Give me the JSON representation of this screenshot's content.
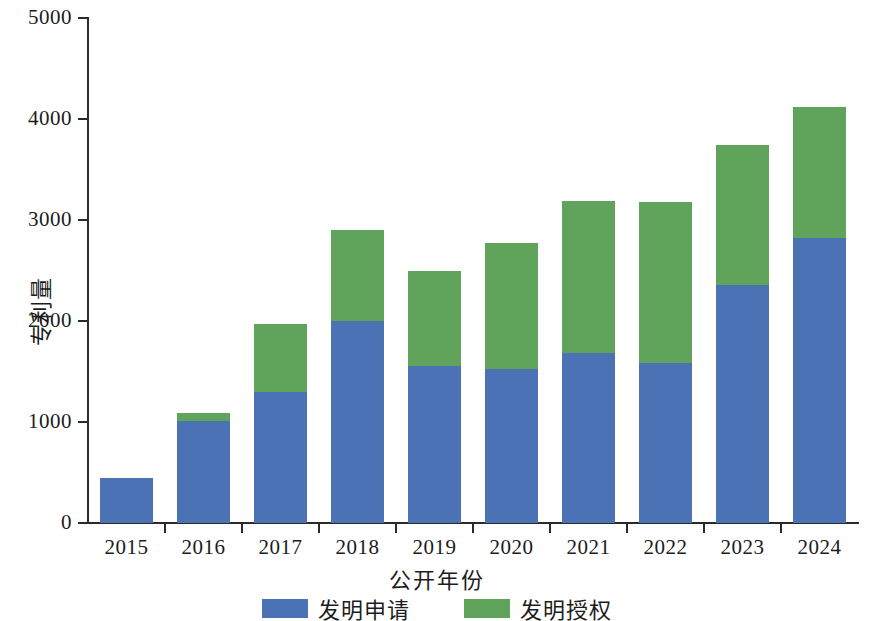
{
  "chart_data": {
    "type": "bar",
    "stacked": true,
    "title": "",
    "xlabel": "公开年份",
    "ylabel": "专利量",
    "categories": [
      "2015",
      "2016",
      "2017",
      "2018",
      "2019",
      "2020",
      "2021",
      "2022",
      "2023",
      "2024"
    ],
    "series": [
      {
        "name": "发明申请",
        "color": "#4a72b5",
        "values": [
          450,
          1010,
          1300,
          2000,
          1555,
          1520,
          1680,
          1580,
          2355,
          2820
        ]
      },
      {
        "name": "发明授权",
        "color": "#5fa45a",
        "values": [
          0,
          80,
          670,
          900,
          945,
          1250,
          1510,
          1600,
          1385,
          1300
        ]
      }
    ],
    "totals": [
      450,
      1090,
      1970,
      2900,
      2500,
      2770,
      3190,
      3180,
      3740,
      4120
    ],
    "ylim": [
      0,
      5000
    ],
    "yticks": [
      0,
      1000,
      2000,
      3000,
      4000,
      5000
    ],
    "ytick_labels": [
      "0",
      "1000",
      "2000",
      "3000",
      "4000",
      "5000"
    ],
    "grid": false,
    "legend_position": "bottom"
  },
  "legend": {
    "items": [
      {
        "label": "发明申请",
        "color": "#4a72b5"
      },
      {
        "label": "发明授权",
        "color": "#5fa45a"
      }
    ]
  }
}
